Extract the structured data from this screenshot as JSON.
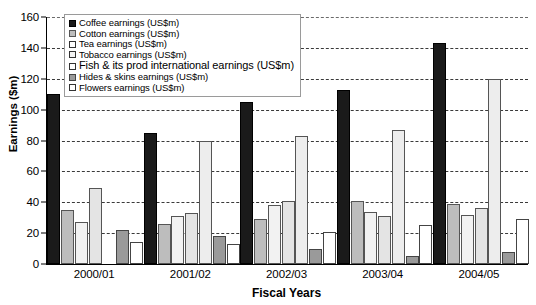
{
  "chart_data": {
    "type": "bar",
    "title": "",
    "xlabel": "Fiscal Years",
    "ylabel": "Earnings ($m)",
    "ylim": [
      0,
      160
    ],
    "ytick_step": 20,
    "yticks": [
      0,
      20,
      40,
      60,
      80,
      100,
      120,
      140,
      160
    ],
    "grid": true,
    "legend_position": "top-center",
    "categories": [
      "2000/01",
      "2001/02",
      "2002/03",
      "2003/04",
      "2004/05"
    ],
    "series": [
      {
        "name": "Coffee earnings (US$m)",
        "swatch": "s-coffee",
        "color": "#1a1a1a",
        "values": [
          110,
          85,
          105,
          113,
          143
        ]
      },
      {
        "name": "Cotton earnings (US$m)",
        "swatch": "s-cotton",
        "color": "#bdbdbd",
        "values": [
          35,
          26,
          29,
          41,
          39
        ]
      },
      {
        "name": "Tea earnings (US$m)",
        "swatch": "s-tea",
        "color": "#f2f2f2",
        "values": [
          27,
          31,
          38,
          34,
          32
        ]
      },
      {
        "name": "Tobacco earnings (US$m)",
        "swatch": "s-tobacco",
        "color": "#e4e4e4",
        "values": [
          49,
          33,
          41,
          31,
          36
        ]
      },
      {
        "name": "Fish & its prod international earnings (US$m)",
        "swatch": "s-fish",
        "color": "#ededed",
        "values": [
          0,
          80,
          83,
          87,
          120
        ]
      },
      {
        "name": "Hides & skins earnings (US$m)",
        "swatch": "s-hides",
        "color": "#9a9a9a",
        "values": [
          22,
          18,
          10,
          5,
          8
        ]
      },
      {
        "name": "Flowers earnings (US$m)",
        "swatch": "s-flowers",
        "color": "#ffffff",
        "values": [
          14,
          13,
          21,
          25,
          29
        ]
      }
    ]
  }
}
